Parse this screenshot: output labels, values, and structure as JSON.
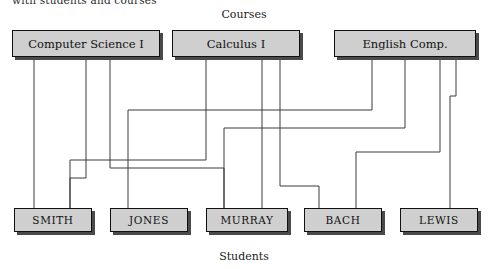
{
  "caption": {
    "clipped_header": "with students and courses"
  },
  "labels": {
    "top": "Courses",
    "bottom": "Students"
  },
  "colors": {
    "node_fill": "#cfcfcf",
    "node_border": "#111111",
    "node_shadow": "#4a4a4a",
    "wire": "#3a3a3a",
    "background": "#ffffff"
  },
  "chart_data": {
    "type": "diagram",
    "subtype": "bipartite-graph",
    "title": "Courses",
    "xlabel": "",
    "ylabel": "Students",
    "grid": false,
    "legend": "none",
    "courses": [
      {
        "id": "cs1",
        "label": "Computer Science I",
        "x": 12,
        "y": 30,
        "width": 148
      },
      {
        "id": "calc1",
        "label": "Calculus I",
        "x": 172,
        "y": 30,
        "width": 128
      },
      {
        "id": "engl",
        "label": "English Comp.",
        "x": 334,
        "y": 30,
        "width": 142
      }
    ],
    "students": [
      {
        "id": "smith",
        "label": "SMITH",
        "x": 14,
        "y": 208,
        "width": 78
      },
      {
        "id": "jones",
        "label": "JONES",
        "x": 110,
        "y": 208,
        "width": 78
      },
      {
        "id": "murray",
        "label": "MURRAY",
        "x": 206,
        "y": 208,
        "width": 82
      },
      {
        "id": "bach",
        "label": "BACH",
        "x": 304,
        "y": 208,
        "width": 78
      },
      {
        "id": "lewis",
        "label": "LEWIS",
        "x": 400,
        "y": 208,
        "width": 78
      }
    ],
    "edges": [
      {
        "from": "cs1",
        "to": "smith",
        "from_x": 34,
        "to_x": 34,
        "channel": 0
      },
      {
        "from": "cs1",
        "to": "jones",
        "from_x": 86,
        "to_x": 70,
        "channel": 178
      },
      {
        "from": "cs1",
        "to": "murray",
        "from_x": 110,
        "to_x": 224,
        "channel": 168
      },
      {
        "from": "calc1",
        "to": "smith",
        "from_x": 206,
        "to_x": 70,
        "channel": 160
      },
      {
        "from": "calc1",
        "to": "murray",
        "from_x": 262,
        "to_x": 263,
        "channel": 0
      },
      {
        "from": "calc1",
        "to": "bach",
        "from_x": 280,
        "to_x": 319,
        "channel": 186
      },
      {
        "from": "engl",
        "to": "jones",
        "from_x": 372,
        "to_x": 128,
        "channel": 110
      },
      {
        "from": "engl",
        "to": "murray",
        "from_x": 405,
        "to_x": 224,
        "channel": 128
      },
      {
        "from": "engl",
        "to": "bach",
        "from_x": 440,
        "to_x": 356,
        "channel": 152
      },
      {
        "from": "engl",
        "to": "lewis",
        "from_x": 456,
        "to_x": 450,
        "channel": 96
      }
    ],
    "counts": {
      "courses": 3,
      "students": 5,
      "edges": 10
    }
  }
}
